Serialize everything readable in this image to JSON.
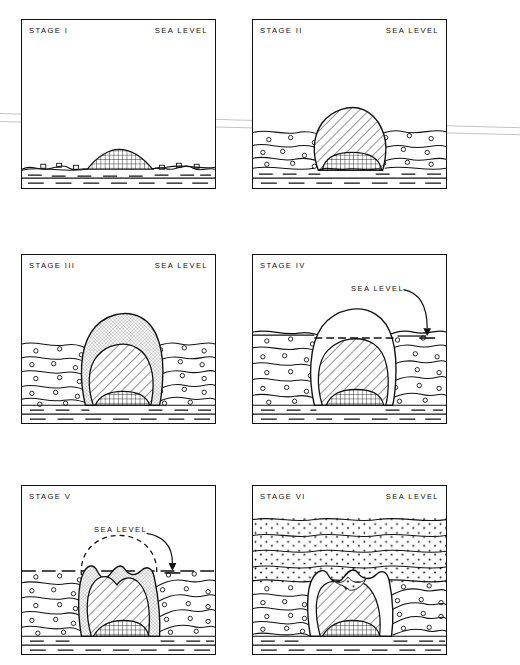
{
  "figure": {
    "background": "#ffffff",
    "ink": "#111111",
    "crease_color": "#b8b8b8"
  },
  "layout": {
    "columns": 2,
    "rows": 3,
    "panel_width": 195,
    "panel_height": 170,
    "col_x": [
      21,
      252
    ],
    "row_y": [
      19,
      254,
      485
    ]
  },
  "legend_textures": {
    "checker": "crosshatch-grid basement / intrusive core",
    "hatch": "diagonal-hatched volcanic edifice",
    "fine_hatch": "fine cross-hatched outer cap",
    "circles": "circle-stippled sediment",
    "dashes": "dashed deep bedded layer",
    "dots": "dotted overburden sediment (Stage VI only)"
  },
  "panels": [
    {
      "id": "stage-1",
      "stage_label": "STAGE  I",
      "sea_level_label": "SEA  LEVEL",
      "sea_level_style": "corner-label",
      "description": "Low submarine mound of checkered basement rock on the sea floor; sea level far above.",
      "has_dome": false,
      "has_arrow": false
    },
    {
      "id": "stage-2",
      "stage_label": "STAGE  II",
      "sea_level_label": "SEA  LEVEL",
      "sea_level_style": "corner-label",
      "description": "Hatched volcanic dome grown up through circle-stippled sediment, crest approaching sea level.",
      "has_dome": true,
      "has_arrow": false
    },
    {
      "id": "stage-3",
      "stage_label": "STAGE  III",
      "sea_level_label": "SEA  LEVEL",
      "sea_level_style": "corner-label",
      "description": "Tall edifice with fine cross-hatched outer cap over the diagonal-hatched core, rising well above the sediment surface.",
      "has_dome": true,
      "has_arrow": false
    },
    {
      "id": "stage-4",
      "stage_label": "STAGE  IV",
      "sea_level_label": "SEA  LEVEL",
      "sea_level_style": "leader-arrow",
      "description": "Sea level marked by an arrow cuts across the edifice; dashed horizon traced through the structure.",
      "has_dome": true,
      "has_arrow": true
    },
    {
      "id": "stage-5",
      "stage_label": "STAGE  V",
      "sea_level_label": "SEA  LEVEL",
      "sea_level_style": "leader-arrow",
      "description": "Crest truncated at sea level forming twin peaks; dashed line shows the eroded former profile.",
      "has_dome": true,
      "has_arrow": true
    },
    {
      "id": "stage-6",
      "stage_label": "STAGE  VI",
      "sea_level_label": "SEA  LEVEL",
      "sea_level_style": "corner-label",
      "description": "Structure buried beneath dotted overburden sediment; sea level above the whole section.",
      "has_dome": true,
      "has_arrow": false
    }
  ]
}
